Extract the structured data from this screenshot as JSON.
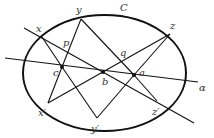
{
  "figure": {
    "curve": {
      "name": "C",
      "cx": 104.5,
      "cy": 73,
      "rx": 81.5,
      "ry": 58
    },
    "points": [
      {
        "id": "x",
        "label": "x",
        "x": 42,
        "y": 37,
        "lx": 36,
        "ly": 32,
        "dot": false
      },
      {
        "id": "y",
        "label": "y",
        "x": 81,
        "y": 19,
        "lx": 76,
        "ly": 13,
        "dot": false
      },
      {
        "id": "z",
        "label": "z",
        "x": 170,
        "y": 34,
        "lx": 170,
        "ly": 29,
        "dot": false
      },
      {
        "id": "p",
        "label": "p",
        "x": 67,
        "y": 48,
        "lx": 63,
        "ly": 46,
        "dot": false
      },
      {
        "id": "q",
        "label": "q",
        "x": 122,
        "y": 60,
        "lx": 120,
        "ly": 56,
        "dot": false
      },
      {
        "id": "c",
        "label": "c",
        "x": 62,
        "y": 67,
        "lx": 53,
        "ly": 76,
        "dot": true
      },
      {
        "id": "b",
        "label": "b",
        "x": 103,
        "y": 72,
        "lx": 102,
        "ly": 85,
        "dot": true
      },
      {
        "id": "a",
        "label": "a",
        "x": 134,
        "y": 75,
        "lx": 139,
        "ly": 76,
        "dot": true
      },
      {
        "id": "x2",
        "label": "x′",
        "x": 48,
        "y": 103,
        "lx": 38,
        "ly": 116,
        "dot": false
      },
      {
        "id": "y2",
        "label": "y′",
        "x": 97,
        "y": 118,
        "lx": 91,
        "ly": 132,
        "dot": false
      },
      {
        "id": "z2",
        "label": "z′",
        "x": 157,
        "y": 101,
        "lx": 152,
        "ly": 115,
        "dot": false
      }
    ],
    "curve_label": {
      "text": "C",
      "x": 120,
      "y": 11
    },
    "axis_label": {
      "text": "α",
      "x": 199,
      "y": 91
    },
    "lines": [
      {
        "id": "alpha",
        "x1": 5,
        "y1": 58,
        "x2": 198,
        "y2": 82
      },
      {
        "id": "x-z2",
        "x1": 24,
        "y1": 28,
        "x2": 194,
        "y2": 123
      },
      {
        "id": "x-c",
        "x1": 42,
        "y1": 37,
        "x2": 62,
        "y2": 67
      },
      {
        "id": "c-y2",
        "x1": 62,
        "y1": 67,
        "x2": 97,
        "y2": 118
      },
      {
        "id": "y-c",
        "x1": 81,
        "y1": 19,
        "x2": 62,
        "y2": 67
      },
      {
        "id": "c-x2",
        "x1": 62,
        "y1": 67,
        "x2": 48,
        "y2": 103
      },
      {
        "id": "y-a",
        "x1": 81,
        "y1": 19,
        "x2": 134,
        "y2": 75
      },
      {
        "id": "a-y2",
        "x1": 134,
        "y1": 75,
        "x2": 97,
        "y2": 118
      },
      {
        "id": "z-x2",
        "x1": 170,
        "y1": 34,
        "x2": 48,
        "y2": 103
      },
      {
        "id": "z-a",
        "x1": 170,
        "y1": 34,
        "x2": 134,
        "y2": 75
      },
      {
        "id": "a-z2",
        "x1": 134,
        "y1": 75,
        "x2": 157,
        "y2": 101
      }
    ]
  }
}
